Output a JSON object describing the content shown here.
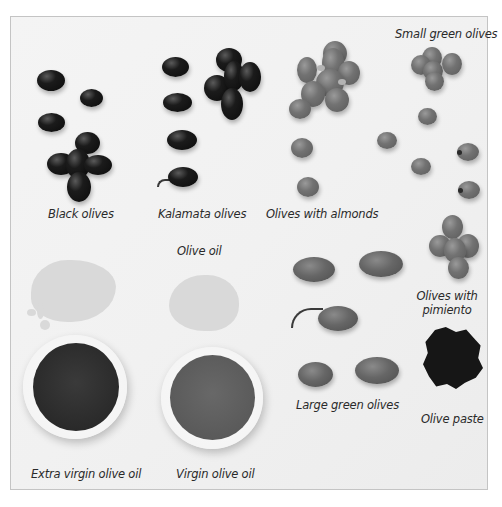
{
  "figure": {
    "labels": {
      "black_olives": "Black olives",
      "kalamata_olives": "Kalamata olives",
      "olives_with_almonds": "Olives with almonds",
      "small_green_olives": "Small green olives",
      "olive_oil": "Olive oil",
      "olives_with_pimiento_line1": "Olives with",
      "olives_with_pimiento_line2": "pimiento",
      "large_green_olives": "Large green olives",
      "olive_paste": "Olive paste",
      "extra_virgin_olive_oil": "Extra virgin olive oil",
      "virgin_olive_oil": "Virgin olive oil"
    },
    "colors": {
      "background": "#ffffff",
      "panel": "#f2f2f2",
      "border": "#c4c4c4",
      "label_text": "#2a2a2a",
      "extra_virgin_oil": "#2e2e2e",
      "virgin_oil": "#5c5c5c",
      "oil_spill": "#d9d9d9"
    }
  }
}
